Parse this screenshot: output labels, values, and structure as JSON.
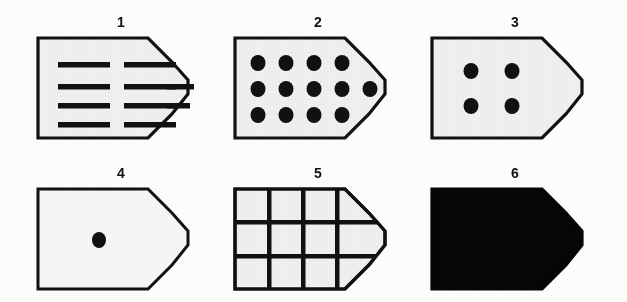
{
  "figure": {
    "background_color": "#fdfdfc",
    "shape_fill_color": "#f0efed",
    "shape_stroke_color": "#111111",
    "mark_color": "#111111",
    "solid_fill_color": "#060606",
    "columns": 3,
    "rows": 2
  },
  "panels": [
    {
      "label": "1",
      "pattern": "horizontal-dashes",
      "description": "pentagon outline with four rows of horizontal dashes",
      "filled": false,
      "rows_of_dashes": [
        2,
        3,
        3,
        2
      ],
      "total_dashes": 10
    },
    {
      "label": "2",
      "pattern": "dots-grid",
      "description": "pentagon outline filled with rows of round dots",
      "filled": false,
      "rows_of_dots": [
        4,
        5,
        4
      ],
      "total_dots": 13
    },
    {
      "label": "3",
      "pattern": "four-dots",
      "description": "pentagon outline with four dots in a two by two square",
      "filled": false,
      "rows_of_dots": [
        2,
        2
      ],
      "total_dots": 4
    },
    {
      "label": "4",
      "pattern": "single-dot",
      "description": "pentagon outline with a single dot left of center",
      "filled": false,
      "rows_of_dots": [
        1
      ],
      "total_dots": 1
    },
    {
      "label": "5",
      "pattern": "grid-lines",
      "description": "pentagon outline divided by grid lines into three rows and four columns",
      "filled": false,
      "grid_rows": 3,
      "grid_columns": 4,
      "total_cells": 12
    },
    {
      "label": "6",
      "pattern": "solid",
      "description": "pentagon completely filled solid black",
      "filled": true,
      "total_marks": 0
    }
  ]
}
